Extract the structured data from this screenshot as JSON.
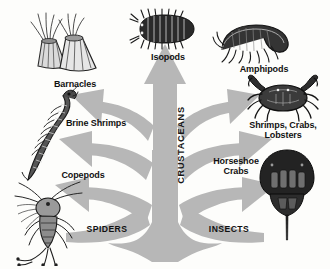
{
  "diagram": {
    "type": "phylogenetic-tree",
    "root_label": "CRUSTACEANS",
    "background_color": "#fdfdfb",
    "tree_color": "#b8b8b8",
    "text_color": "#111111"
  },
  "labels": {
    "isopods": "Isopods",
    "amphipods": "Amphipods",
    "barnacles": "Barnacles",
    "brine_shrimps": "Brine Shrimps",
    "shrimps_crabs_lobsters": "Shrimps, Crabs,\nLobsters",
    "horseshoe_crabs": "Horseshoe\nCrabs",
    "copepods": "Copepods",
    "spiders": "SPIDERS",
    "insects": "INSECTS",
    "crustaceans": "CRUSTACEANS"
  },
  "branches": [
    {
      "name": "copepods",
      "label": "Copepods",
      "side": "left",
      "level": 1
    },
    {
      "name": "brine-shrimps",
      "label": "Brine Shrimps",
      "side": "left",
      "level": 2
    },
    {
      "name": "barnacles",
      "label": "Barnacles",
      "side": "left",
      "level": 3
    },
    {
      "name": "isopods",
      "label": "Isopods",
      "side": "center",
      "level": 4
    },
    {
      "name": "amphipods",
      "label": "Amphipods",
      "side": "right",
      "level": 3
    },
    {
      "name": "shrimps-crabs-lobsters",
      "label": "Shrimps, Crabs, Lobsters",
      "side": "right",
      "level": 2
    },
    {
      "name": "horseshoe-crabs",
      "label": "Horseshoe Crabs",
      "side": "right",
      "level": 1
    }
  ],
  "roots": [
    {
      "name": "spiders",
      "label": "SPIDERS",
      "side": "left"
    },
    {
      "name": "insects",
      "label": "INSECTS",
      "side": "right"
    }
  ],
  "organisms": [
    {
      "name": "isopod",
      "label": "Isopods"
    },
    {
      "name": "amphipod",
      "label": "Amphipods"
    },
    {
      "name": "barnacle",
      "label": "Barnacles"
    },
    {
      "name": "brine-shrimp",
      "label": "Brine Shrimps"
    },
    {
      "name": "crab",
      "label": "Shrimps, Crabs, Lobsters"
    },
    {
      "name": "horseshoe-crab",
      "label": "Horseshoe Crabs"
    },
    {
      "name": "copepod",
      "label": "Copepods"
    }
  ]
}
